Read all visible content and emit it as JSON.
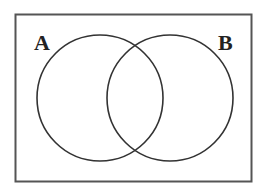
{
  "diagram": {
    "type": "venn",
    "universe": {
      "x": 15,
      "y": 14,
      "width": 237,
      "height": 168,
      "stroke": "#555555"
    },
    "sets": [
      {
        "label": "A",
        "cx": 100,
        "cy": 98,
        "r": 63,
        "label_x": 34,
        "label_y": 50
      },
      {
        "label": "B",
        "cx": 170,
        "cy": 98,
        "r": 63,
        "label_x": 220,
        "label_y": 50
      }
    ],
    "stroke_color": "#333333",
    "background": "#ffffff"
  }
}
